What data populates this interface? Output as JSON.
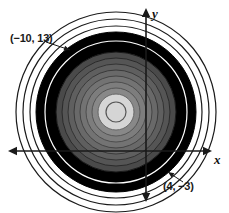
{
  "figure": {
    "background_color": "#ffffff"
  },
  "axes": {
    "x_axis": {
      "label": "x",
      "y_position": 151,
      "x_start": 8,
      "x_end": 212,
      "arrow_left": true,
      "arrow_right": true,
      "color": "#1a1a1a"
    },
    "y_axis": {
      "label": "y",
      "x_position": 146,
      "y_start": 8,
      "y_end": 202,
      "arrow_up": true,
      "arrow_down": true,
      "color": "#1a1a1a"
    }
  },
  "annotations": [
    {
      "name": "point-label-upper-left",
      "text": "(−10, 13)",
      "x": 10,
      "y": 32,
      "leader_to": {
        "x": 70,
        "y": 50
      }
    },
    {
      "name": "point-label-lower-right",
      "text": "(4, −3)",
      "x": 163,
      "y": 180,
      "leader_to": {
        "x": 168,
        "y": 172
      }
    }
  ],
  "chart_data": {
    "type": "diagram",
    "subtype": "concentric-circles",
    "center": {
      "x": 116,
      "y": 112
    },
    "xlabel": "x",
    "ylabel": "y",
    "grid": false,
    "legend": "none",
    "rings": [
      {
        "index": 1,
        "radius": 100,
        "fill": "#ffffff",
        "stroke": "#1a1a1a",
        "stroke_width": 1.2
      },
      {
        "index": 2,
        "radius": 93,
        "fill": "#ffffff",
        "stroke": "#1a1a1a",
        "stroke_width": 1.2
      },
      {
        "index": 3,
        "radius": 86,
        "fill": "#ffffff",
        "stroke": "#1a1a1a",
        "stroke_width": 1.2
      },
      {
        "index": 4,
        "radius": 80,
        "fill": "#000000",
        "stroke": "#000000",
        "stroke_width": 1
      },
      {
        "index": 5,
        "radius": 71,
        "fill": "#000000",
        "stroke": "#ffffff",
        "stroke_width": 1.2
      },
      {
        "index": 6,
        "radius": 66,
        "fill": "#000000",
        "stroke": "#000000",
        "stroke_width": 1
      },
      {
        "index": 7,
        "radius": 60,
        "fill": "#4a4a4a",
        "stroke": "#1a1a1a",
        "stroke_width": 1
      },
      {
        "index": 8,
        "radius": 54,
        "fill": "#555555",
        "stroke": "#2a2a2a",
        "stroke_width": 1
      },
      {
        "index": 9,
        "radius": 48,
        "fill": "#5f5f5f",
        "stroke": "#333333",
        "stroke_width": 1
      },
      {
        "index": 10,
        "radius": 42,
        "fill": "#696969",
        "stroke": "#3a3a3a",
        "stroke_width": 1
      },
      {
        "index": 11,
        "radius": 36,
        "fill": "#737373",
        "stroke": "#444444",
        "stroke_width": 1
      },
      {
        "index": 12,
        "radius": 30,
        "fill": "#7d7d7d",
        "stroke": "#4d4d4d",
        "stroke_width": 1
      },
      {
        "index": 13,
        "radius": 24,
        "fill": "#888888",
        "stroke": "#555555",
        "stroke_width": 1
      },
      {
        "index": 14,
        "radius": 18,
        "fill": "#d5d5d5",
        "stroke": "#666666",
        "stroke_width": 1
      },
      {
        "index": 15,
        "radius": 10,
        "fill": "#d5d5d5",
        "stroke": "#555555",
        "stroke_width": 1.2
      }
    ],
    "ring_count": 15,
    "colors": {
      "outer_outline": "#1a1a1a",
      "black_band": "#000000",
      "center_core": "#d5d5d5",
      "background": "#ffffff"
    }
  }
}
